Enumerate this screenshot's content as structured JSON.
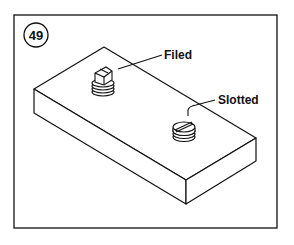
{
  "figure": {
    "number": "49",
    "labels": {
      "filed": "Filed",
      "slotted": "Slotted"
    },
    "colors": {
      "ink": "#111111",
      "background": "#ffffff"
    }
  }
}
